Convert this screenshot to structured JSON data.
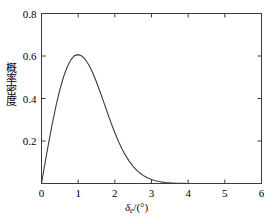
{
  "figure": {
    "background_color": "#ffffff",
    "frame_color": "#3a3a3a",
    "curve_color": "#3d3d3d"
  },
  "axis_labels": {
    "x_variable": "δ",
    "x_subscript": "e",
    "x_units": "/(°)",
    "x_full": "δe/(°)",
    "y_label": "概率密度"
  },
  "ticks": {
    "x": [
      "0",
      "1",
      "2",
      "3",
      "4",
      "5",
      "6"
    ],
    "y": [
      "0",
      "0.2",
      "0.4",
      "0.6",
      "0.8"
    ]
  },
  "chart_data": {
    "type": "line",
    "title": "",
    "xlabel": "δe/(°)",
    "ylabel": "概率密度",
    "xlim": [
      0,
      6
    ],
    "ylim": [
      0,
      0.8
    ],
    "xticks": [
      0,
      1,
      2,
      3,
      4,
      5,
      6
    ],
    "yticks": [
      0,
      0.2,
      0.4,
      0.6,
      0.8
    ],
    "grid": false,
    "legend": null,
    "distribution": "Rayleigh",
    "sigma": 1.0,
    "peak_x": 1.0,
    "peak_y": 0.6065,
    "series": [
      {
        "name": "probability density",
        "x": [
          0.0,
          0.1,
          0.2,
          0.3,
          0.4,
          0.5,
          0.6,
          0.7,
          0.8,
          0.9,
          1.0,
          1.1,
          1.2,
          1.3,
          1.4,
          1.5,
          1.6,
          1.7,
          1.8,
          1.9,
          2.0,
          2.1,
          2.2,
          2.3,
          2.4,
          2.5,
          2.6,
          2.7,
          2.8,
          2.9,
          3.0,
          3.1,
          3.2,
          3.3,
          3.4,
          3.5,
          3.6,
          3.7,
          3.8,
          3.9,
          4.0,
          4.2,
          4.4,
          4.6,
          4.8,
          5.0,
          5.2,
          5.4,
          5.6,
          5.8,
          6.0
        ],
        "y": [
          0.0,
          0.0995,
          0.196,
          0.2868,
          0.3692,
          0.4412,
          0.5011,
          0.5481,
          0.5816,
          0.6019,
          0.6065,
          0.6,
          0.5827,
          0.5555,
          0.5198,
          0.4775,
          0.4307,
          0.3816,
          0.332,
          0.284,
          0.2389,
          0.1979,
          0.1616,
          0.13,
          0.1031,
          0.0804,
          0.0618,
          0.0468,
          0.0349,
          0.0256,
          0.0185,
          0.0132,
          0.0093,
          0.0064,
          0.0044,
          0.003,
          0.002,
          0.0013,
          0.0008,
          0.0005,
          0.0003,
          0.0001,
          0.0001,
          0.0,
          0.0,
          0.0,
          0.0,
          0.0,
          0.0,
          0.0,
          0.0
        ]
      }
    ]
  }
}
